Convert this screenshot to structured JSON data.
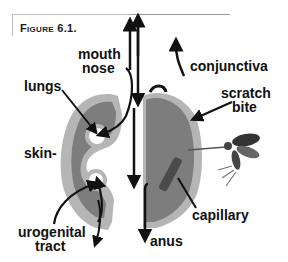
{
  "figure": {
    "title": "Figure 6.1."
  },
  "labels": {
    "mouth": "mouth",
    "nose": "nose",
    "conjunctiva": "conjunctiva",
    "lungs": "lungs",
    "scratch": "scratch",
    "bite": "bite",
    "skin": "skin-",
    "capillary": "capillary",
    "urogenital": "urogenital",
    "tract": "tract",
    "anus": "anus"
  },
  "colors": {
    "outer_body": "#b5b5b5",
    "inner_body": "#7d7d7d",
    "arrow": "#111111",
    "capillary": "#4a4a4a",
    "insect": "#444444"
  }
}
